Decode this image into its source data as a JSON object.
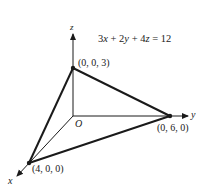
{
  "diagram": {
    "equation": "3x + 2y + 4z = 12",
    "equation_parts": {
      "a": "3",
      "x": "x",
      "p1": " + 2",
      "y": "y",
      "p2": " + 4",
      "z": "z",
      "rhs": " = 12"
    },
    "axes": {
      "x_label": "x",
      "y_label": "y",
      "z_label": "z",
      "origin_label": "O"
    },
    "points": [
      {
        "name": "x-intercept",
        "label": "(4, 0, 0)"
      },
      {
        "name": "y-intercept",
        "label": "(0, 6, 0)"
      },
      {
        "name": "z-intercept",
        "label": "(0, 0, 3)"
      }
    ],
    "colors": {
      "ink": "#1a1a1a",
      "background": "#ffffff"
    }
  }
}
